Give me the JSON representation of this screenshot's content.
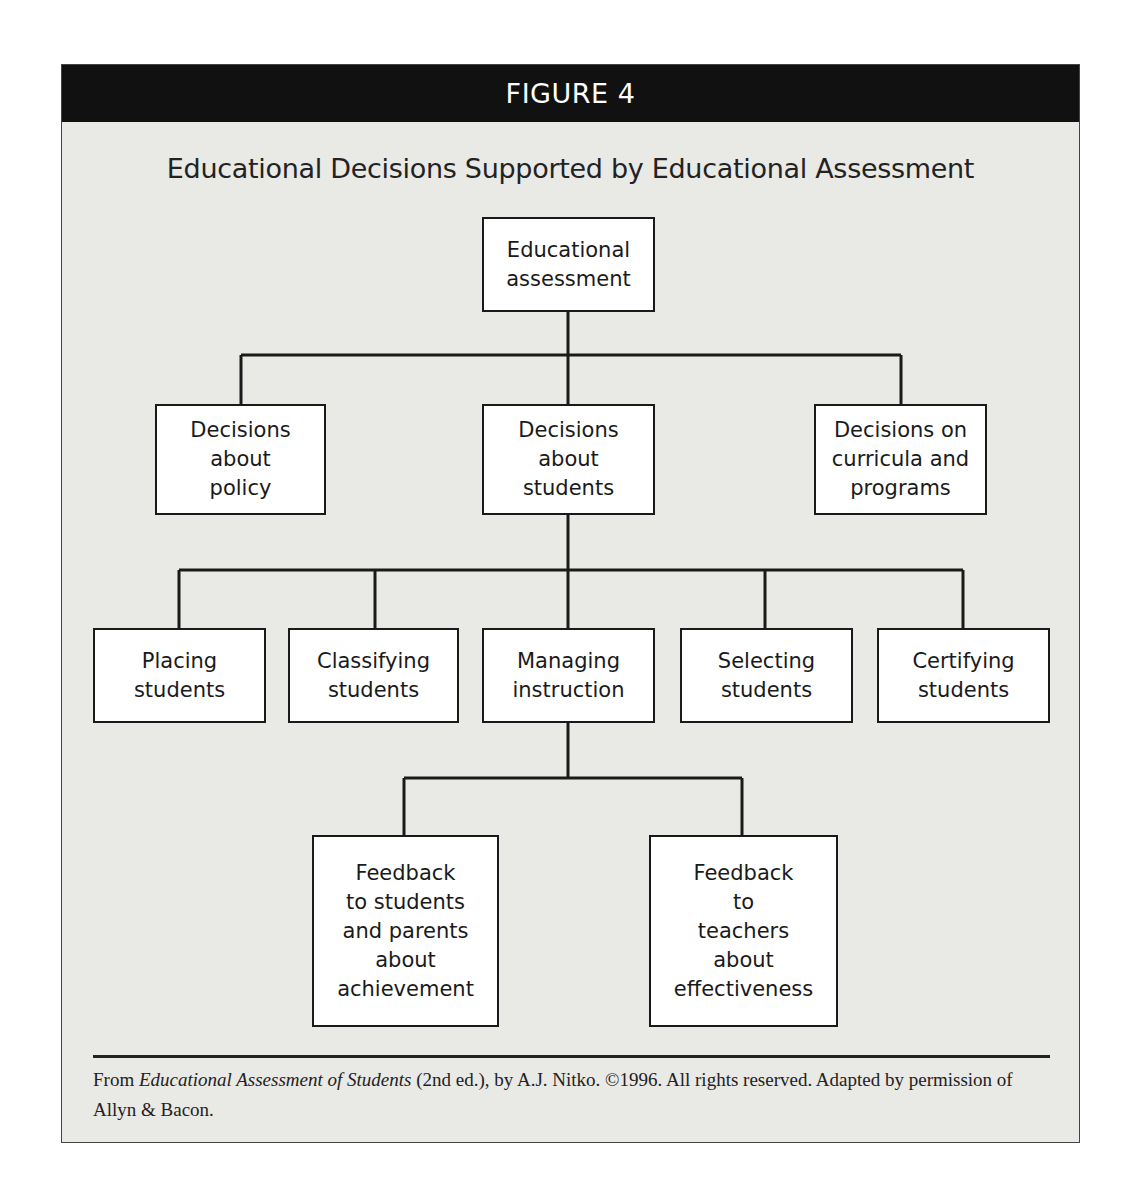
{
  "figure": {
    "label": "FIGURE 4",
    "title": "Educational Decisions Supported by Educational Assessment"
  },
  "nodes": {
    "root": "Educational\nassessment",
    "policy": "Decisions\nabout\npolicy",
    "students": "Decisions\nabout\nstudents",
    "curricula": "Decisions on\ncurricula and\nprograms",
    "placing": "Placing\nstudents",
    "classifying": "Classifying\nstudents",
    "managing": "Managing\ninstruction",
    "selecting": "Selecting\nstudents",
    "certifying": "Certifying\nstudents",
    "feedback_students": "Feedback\nto students\nand parents\nabout\nachievement",
    "feedback_teachers": "Feedback\nto\nteachers\nabout\neffectiveness"
  },
  "credit": {
    "prefix": "From ",
    "book": "Educational Assessment of Students",
    "suffix": " (2nd ed.), by A.J. Nitko. ©1996. All rights reserved. Adapted by permission of Allyn & Bacon."
  }
}
